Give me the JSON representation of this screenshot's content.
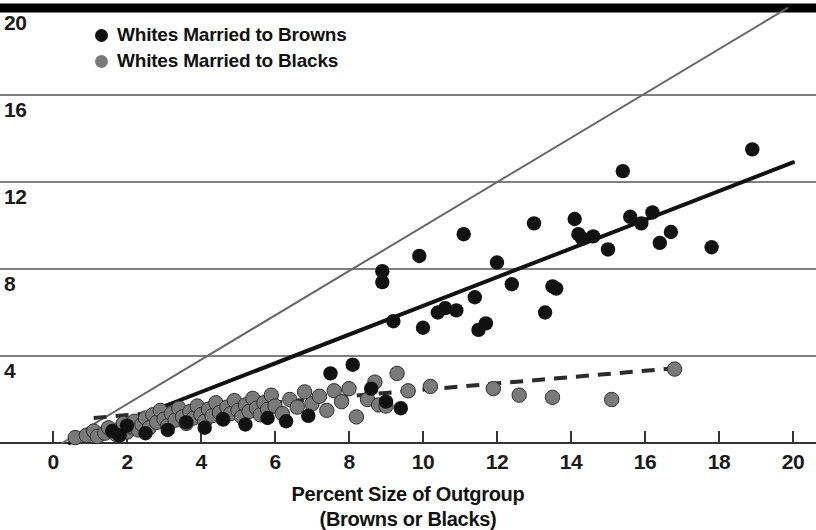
{
  "chart_data": {
    "type": "scatter",
    "title": "",
    "xlabel": "Percent Size of Outgroup (Browns or Blacks)",
    "xlabel_line1": "Percent Size of Outgroup",
    "xlabel_line2": "(Browns or Blacks)",
    "ylabel": "",
    "xlim": [
      0,
      20
    ],
    "ylim": [
      0,
      20
    ],
    "xticks": [
      0,
      2,
      4,
      6,
      8,
      10,
      12,
      14,
      16,
      18,
      20
    ],
    "xticklabels": [
      "0",
      "2",
      "4",
      "6",
      "8",
      "10",
      "12",
      "14",
      "16",
      "18",
      "20"
    ],
    "yticks": [
      4,
      8,
      12,
      16,
      20
    ],
    "yticklabels": [
      "4",
      "8",
      "12",
      "16",
      "20"
    ],
    "grid": "horizontal",
    "legend_position": "top-left",
    "colors": {
      "browns_marker": "#111111",
      "blacks_marker": "#7a7a7a",
      "browns_fit": "#111111",
      "blacks_fit": "#3a3a3a",
      "parity_line": "#666666",
      "gridline": "#555555",
      "axis": "#333333",
      "top_border": "#000000"
    },
    "series": [
      {
        "name": "Whites Married to Browns",
        "marker": "filled-circle",
        "color": "#111111",
        "points": [
          [
            1.6,
            0.55
          ],
          [
            1.8,
            0.35
          ],
          [
            2.0,
            0.8
          ],
          [
            2.5,
            0.45
          ],
          [
            3.1,
            0.6
          ],
          [
            3.6,
            0.95
          ],
          [
            4.1,
            0.7
          ],
          [
            4.6,
            1.1
          ],
          [
            5.2,
            0.85
          ],
          [
            5.8,
            1.15
          ],
          [
            6.3,
            1.0
          ],
          [
            6.9,
            1.25
          ],
          [
            7.5,
            3.2
          ],
          [
            8.1,
            3.6
          ],
          [
            8.6,
            2.5
          ],
          [
            8.9,
            7.9
          ],
          [
            8.9,
            7.4
          ],
          [
            9.0,
            1.9
          ],
          [
            9.2,
            5.6
          ],
          [
            9.4,
            1.6
          ],
          [
            9.9,
            8.6
          ],
          [
            10.0,
            5.3
          ],
          [
            10.4,
            6.0
          ],
          [
            10.6,
            6.2
          ],
          [
            10.9,
            6.1
          ],
          [
            11.1,
            9.6
          ],
          [
            11.4,
            6.7
          ],
          [
            11.5,
            5.2
          ],
          [
            11.7,
            5.5
          ],
          [
            12.0,
            8.3
          ],
          [
            12.4,
            7.3
          ],
          [
            13.0,
            10.1
          ],
          [
            13.3,
            6.0
          ],
          [
            13.5,
            7.2
          ],
          [
            13.6,
            7.1
          ],
          [
            14.1,
            10.3
          ],
          [
            14.2,
            9.6
          ],
          [
            14.3,
            9.4
          ],
          [
            14.6,
            9.5
          ],
          [
            15.0,
            8.9
          ],
          [
            15.4,
            12.5
          ],
          [
            15.6,
            10.4
          ],
          [
            15.9,
            10.1
          ],
          [
            16.2,
            10.6
          ],
          [
            16.4,
            9.2
          ],
          [
            16.7,
            9.7
          ],
          [
            17.8,
            9.0
          ],
          [
            18.9,
            13.5
          ]
        ]
      },
      {
        "name": "Whites Married to Blacks",
        "marker": "filled-circle",
        "color": "#7a7a7a",
        "points": [
          [
            0.6,
            0.25
          ],
          [
            0.9,
            0.35
          ],
          [
            1.1,
            0.55
          ],
          [
            1.2,
            0.3
          ],
          [
            1.4,
            0.45
          ],
          [
            1.5,
            0.7
          ],
          [
            1.7,
            0.4
          ],
          [
            1.8,
            0.65
          ],
          [
            1.9,
            0.9
          ],
          [
            2.0,
            0.5
          ],
          [
            2.1,
            0.75
          ],
          [
            2.2,
            1.0
          ],
          [
            2.3,
            0.6
          ],
          [
            2.4,
            0.85
          ],
          [
            2.5,
            1.15
          ],
          [
            2.6,
            0.7
          ],
          [
            2.7,
            1.3
          ],
          [
            2.8,
            0.95
          ],
          [
            2.9,
            1.5
          ],
          [
            3.0,
            1.1
          ],
          [
            3.1,
            0.8
          ],
          [
            3.2,
            1.35
          ],
          [
            3.3,
            1.05
          ],
          [
            3.4,
            1.6
          ],
          [
            3.5,
            1.2
          ],
          [
            3.6,
            0.9
          ],
          [
            3.7,
            1.45
          ],
          [
            3.8,
            1.15
          ],
          [
            3.9,
            1.7
          ],
          [
            4.0,
            1.3
          ],
          [
            4.1,
            1.0
          ],
          [
            4.2,
            1.55
          ],
          [
            4.3,
            1.25
          ],
          [
            4.4,
            1.85
          ],
          [
            4.5,
            1.4
          ],
          [
            4.6,
            1.1
          ],
          [
            4.7,
            1.65
          ],
          [
            4.8,
            1.35
          ],
          [
            4.9,
            1.95
          ],
          [
            5.0,
            1.5
          ],
          [
            5.1,
            1.2
          ],
          [
            5.2,
            1.75
          ],
          [
            5.3,
            1.45
          ],
          [
            5.4,
            2.05
          ],
          [
            5.5,
            1.6
          ],
          [
            5.6,
            1.3
          ],
          [
            5.7,
            1.85
          ],
          [
            5.8,
            1.55
          ],
          [
            5.9,
            2.2
          ],
          [
            6.0,
            1.7
          ],
          [
            6.2,
            1.35
          ],
          [
            6.4,
            2.0
          ],
          [
            6.6,
            1.65
          ],
          [
            6.8,
            2.35
          ],
          [
            7.0,
            1.8
          ],
          [
            7.2,
            2.15
          ],
          [
            7.4,
            1.5
          ],
          [
            7.6,
            2.4
          ],
          [
            7.8,
            1.9
          ],
          [
            8.0,
            2.5
          ],
          [
            8.2,
            1.2
          ],
          [
            8.5,
            2.0
          ],
          [
            8.7,
            2.8
          ],
          [
            8.8,
            1.75
          ],
          [
            9.0,
            1.7
          ],
          [
            9.3,
            3.2
          ],
          [
            9.6,
            2.4
          ],
          [
            10.2,
            2.6
          ],
          [
            11.9,
            2.5
          ],
          [
            12.6,
            2.2
          ],
          [
            13.5,
            2.1
          ],
          [
            15.1,
            2.0
          ],
          [
            16.8,
            3.4
          ]
        ]
      }
    ],
    "lines": [
      {
        "name": "parity-line",
        "style": "solid-thin",
        "color": "#666666",
        "width": 2,
        "from": [
          0.25,
          0.0
        ],
        "to": [
          19.85,
          20.0
        ]
      },
      {
        "name": "browns-regression",
        "style": "solid-thick",
        "color": "#111111",
        "width": 4,
        "from": [
          0.45,
          0.0
        ],
        "to": [
          20.0,
          12.9
        ]
      },
      {
        "name": "blacks-regression",
        "style": "dashed",
        "color": "#2b2b2b",
        "width": 4,
        "from": [
          1.1,
          1.15
        ],
        "to": [
          16.9,
          3.45
        ]
      }
    ]
  },
  "legend": {
    "items": [
      {
        "label": "Whites Married to Browns",
        "color": "#111111"
      },
      {
        "label": "Whites Married to Blacks",
        "color": "#7a7a7a"
      }
    ]
  }
}
